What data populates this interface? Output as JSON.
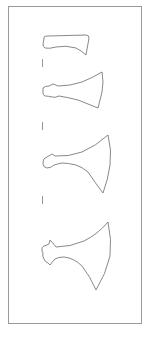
{
  "figure": {
    "colors": {
      "background": "#ffffff",
      "frame": "#9a9a9a",
      "outline": "#7a7a7a"
    },
    "items": [
      {
        "name": "axe-head-1",
        "shape": "narrow bearded axe head"
      },
      {
        "name": "axe-head-2",
        "shape": "flared axe head"
      },
      {
        "name": "axe-head-3",
        "shape": "broad flared axe head"
      },
      {
        "name": "axe-head-4",
        "shape": "broad axe head with lugged socket"
      }
    ],
    "tick_marks": 3
  }
}
